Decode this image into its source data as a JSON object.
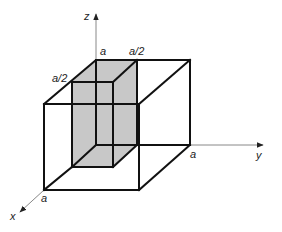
{
  "diagram": {
    "type": "cube-with-inner-box",
    "colors": {
      "edge": "#111111",
      "axis": "#888888",
      "shade": "#c8c8c8",
      "background": "#ffffff"
    },
    "axes": {
      "x": {
        "label": "x"
      },
      "y": {
        "label": "y"
      },
      "z": {
        "label": "z"
      }
    },
    "labels": {
      "z_top_a": "a",
      "top_a_half": "a/2",
      "left_a_half": "a/2",
      "y_a": "a",
      "x_a": "a"
    }
  }
}
